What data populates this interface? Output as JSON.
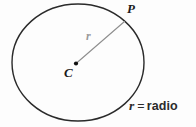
{
  "figure": {
    "type": "geometry-diagram",
    "background_color": "#fdfdfd",
    "width": 196,
    "height": 127
  },
  "labels": {
    "point_p": "P",
    "center_c": "C",
    "radius_symbol": "r"
  },
  "legend": {
    "symbol": "r",
    "equals": "=",
    "term": "radio",
    "full_text": "r = radio"
  },
  "geometry": {
    "circle": {
      "cx": 78,
      "cy": 62.5,
      "rx": 66,
      "ry": 58.5,
      "stroke_color": "#2a2a2a",
      "stroke_width": 1.4,
      "fill": "none"
    },
    "center_point": {
      "x": 76,
      "y": 63.5,
      "radius": 2.1,
      "color": "#111111"
    },
    "radius_segment": {
      "x1": 76,
      "y1": 63.5,
      "x2": 124.5,
      "y2": 21.5,
      "stroke_color": "#8e8e8e",
      "stroke_width": 1.1
    }
  },
  "colors": {
    "ink": "#1c1c1c",
    "outline": "#2a2a2a",
    "muted": "#9a9a9a",
    "legend_ink": "#2b2b2b",
    "background": "#fdfdfd"
  }
}
